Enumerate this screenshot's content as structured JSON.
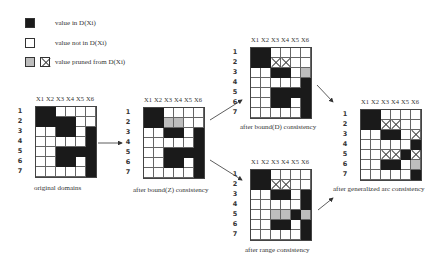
{
  "legend": {
    "items": [
      {
        "symbol": "filled-black",
        "label": "value in D(Xi)"
      },
      {
        "symbol": "empty",
        "label": "value not in D(Xi)"
      },
      {
        "symbol": "hatched-or-crossed",
        "label": "value pruned from D(Xi)"
      }
    ]
  },
  "columns": [
    "X1",
    "X2",
    "X3",
    "X4",
    "X5",
    "X6"
  ],
  "rows": [
    "1",
    "2",
    "3",
    "4",
    "5",
    "6",
    "7"
  ],
  "grids": [
    {
      "id": "original",
      "caption": "original domains",
      "cells": [
        "BBWWWW",
        "BBBBWW",
        "WWBBWB",
        "WWWWWB",
        "WWBBBB",
        "WWBBWB",
        "WWWWWB"
      ]
    },
    {
      "id": "boundZ",
      "caption": "after bound(Z) consistency",
      "cells": [
        "BBWWWW",
        "BBHHWW",
        "WWBBWB",
        "WWWWWB",
        "WWBBBB",
        "WWBBWB",
        "WWWWWB"
      ]
    },
    {
      "id": "boundD",
      "caption": "after bound(D) consistency",
      "cells": [
        "BBWWWW",
        "BBXXWW",
        "WWBBWH",
        "WWWWWB",
        "WWBBBB",
        "WWBBWB",
        "WWWWWB"
      ]
    },
    {
      "id": "range",
      "caption": "after range consistency",
      "cells": [
        "BBWWWW",
        "BBXXWW",
        "WWBBWB",
        "WWWWWB",
        "WWHHBH",
        "WWBBWB",
        "WWWWWB"
      ]
    },
    {
      "id": "gac",
      "caption": "after generalized arc consistency",
      "cells": [
        "BBWWWW",
        "BBXXWW",
        "WWBBWX",
        "WWWWWB",
        "WWXXBX",
        "WWBBWH",
        "WWWWWB"
      ]
    }
  ]
}
